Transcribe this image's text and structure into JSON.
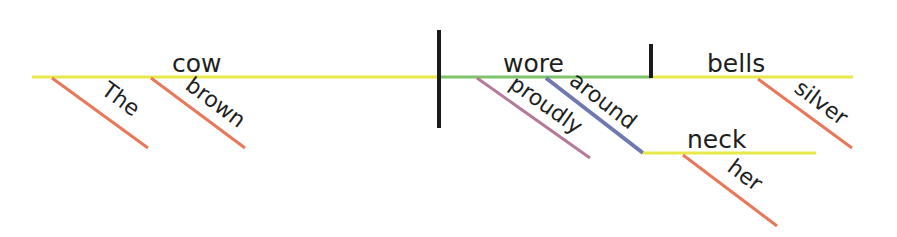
{
  "diagram": {
    "type": "sentence-diagram",
    "sentence": "The brown cow proudly wore silver bells around her neck",
    "colors": {
      "subject_line": "#e8e84a",
      "predicate_line": "#7fc46a",
      "object_line": "#e8e84a",
      "adjective_line": "#e8785a",
      "adverb_line": "#b57a9a",
      "preposition_line": "#6f78b0",
      "divider": "#1a1a1a",
      "text": "#1e1e1e"
    },
    "subject": {
      "word": "cow",
      "modifiers": [
        {
          "word": "The",
          "role": "article"
        },
        {
          "word": "brown",
          "role": "adjective"
        }
      ]
    },
    "verb": {
      "word": "wore",
      "modifiers": [
        {
          "word": "proudly",
          "role": "adverb"
        },
        {
          "word": "around",
          "role": "preposition",
          "object": {
            "word": "neck",
            "modifiers": [
              {
                "word": "her",
                "role": "possessive"
              }
            ]
          }
        }
      ]
    },
    "direct_object": {
      "word": "bells",
      "modifiers": [
        {
          "word": "silver",
          "role": "adjective"
        }
      ]
    }
  }
}
